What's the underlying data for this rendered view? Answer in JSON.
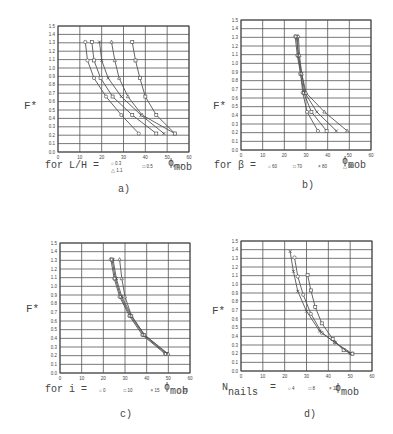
{
  "figure": {
    "panels": [
      {
        "id": "a",
        "caption": "a)",
        "ylabel": "F*",
        "xlabel_symbol": "ϕ",
        "xlabel_sub": "mob",
        "legend_prefix": "for L/H =",
        "legend_items": [
          "○ 0.3",
          "□ 0.5",
          "× 0.7"
        ],
        "legend_items_2": [
          "△ 1.1"
        ]
      },
      {
        "id": "b",
        "caption": "b)",
        "ylabel": "F*",
        "xlabel_symbol": "ϕ",
        "xlabel_sub": "mob",
        "legend_prefix": "for β =",
        "legend_items": [
          "○ 60",
          "□ 70",
          "× 80",
          "△ 90"
        ]
      },
      {
        "id": "c",
        "caption": "c)",
        "ylabel": "F*",
        "xlabel_symbol": "ϕ",
        "xlabel_sub": "mob",
        "legend_prefix": "for i =",
        "legend_items": [
          "○ 0",
          "□ 10",
          "× 15",
          "△ 20"
        ]
      },
      {
        "id": "d",
        "caption": "d)",
        "ylabel": "F*",
        "xlabel_symbol": "ϕ",
        "xlabel_sub": "mob",
        "legend_prefix_main": "N",
        "legend_prefix_sub": "nails",
        "legend_eq": "=",
        "legend_items": [
          "○ 4",
          "□ 8",
          "× 12"
        ]
      }
    ]
  },
  "chart_data": [
    {
      "type": "line",
      "title": "a)",
      "xlabel": "ϕmob",
      "ylabel": "F*",
      "xlim": [
        0,
        60
      ],
      "ylim": [
        0,
        1.5
      ],
      "xticks": [
        0,
        10,
        20,
        30,
        40,
        50,
        60
      ],
      "yticks": [
        0.0,
        0.1,
        0.2,
        0.3,
        0.4,
        0.5,
        0.6,
        0.7,
        0.8,
        0.9,
        1.0,
        1.1,
        1.2,
        1.3,
        1.4,
        1.5
      ],
      "grid": true,
      "legend": "for L/H",
      "series": [
        {
          "name": "0.3",
          "points": [
            [
              12.5,
              1.31
            ],
            [
              13.5,
              1.09
            ],
            [
              16.5,
              0.88
            ],
            [
              22,
              0.66
            ],
            [
              29,
              0.44
            ],
            [
              37,
              0.22
            ]
          ]
        },
        {
          "name": "0.5",
          "points": [
            [
              15.5,
              1.31
            ],
            [
              16.5,
              1.09
            ],
            [
              19.5,
              0.88
            ],
            [
              25,
              0.66
            ],
            [
              34,
              0.44
            ],
            [
              45,
              0.22
            ]
          ]
        },
        {
          "name": "0.7",
          "points": [
            [
              19,
              1.31
            ],
            [
              20,
              1.09
            ],
            [
              23,
              0.88
            ],
            [
              29,
              0.66
            ],
            [
              38,
              0.44
            ],
            [
              48.5,
              0.22
            ]
          ]
        },
        {
          "name": "1.1",
          "points": [
            [
              24.5,
              1.31
            ],
            [
              26,
              1.09
            ],
            [
              28,
              0.88
            ],
            [
              32,
              0.66
            ],
            [
              38.5,
              0.44
            ],
            [
              53.5,
              0.22
            ]
          ]
        },
        {
          "name": "extra",
          "points": [
            [
              34,
              1.31
            ],
            [
              35.5,
              1.09
            ],
            [
              37.5,
              0.88
            ],
            [
              40,
              0.66
            ],
            [
              45,
              0.44
            ],
            [
              53.5,
              0.22
            ]
          ]
        }
      ]
    },
    {
      "type": "line",
      "title": "b)",
      "xlabel": "ϕmob",
      "ylabel": "F*",
      "xlim": [
        0,
        60
      ],
      "ylim": [
        0,
        1.5
      ],
      "xticks": [
        0,
        10,
        20,
        30,
        40,
        50,
        60
      ],
      "yticks": [
        0.0,
        0.1,
        0.2,
        0.3,
        0.4,
        0.5,
        0.6,
        0.7,
        0.8,
        0.9,
        1.0,
        1.1,
        1.2,
        1.3,
        1.4,
        1.5
      ],
      "grid": true,
      "legend": "for β",
      "series": [
        {
          "name": "60",
          "points": [
            [
              25,
              1.31
            ],
            [
              26,
              1.09
            ],
            [
              27.5,
              0.88
            ],
            [
              28.5,
              0.66
            ],
            [
              30.5,
              0.44
            ],
            [
              35.5,
              0.22
            ]
          ]
        },
        {
          "name": "70",
          "points": [
            [
              25.5,
              1.31
            ],
            [
              26.5,
              1.09
            ],
            [
              27.5,
              0.88
            ],
            [
              29,
              0.66
            ],
            [
              32.5,
              0.44
            ],
            [
              39.5,
              0.22
            ]
          ]
        },
        {
          "name": "80",
          "points": [
            [
              26,
              1.31
            ],
            [
              26.5,
              1.09
            ],
            [
              28,
              0.88
            ],
            [
              29.5,
              0.66
            ],
            [
              35,
              0.44
            ],
            [
              44,
              0.22
            ]
          ]
        },
        {
          "name": "90",
          "points": [
            [
              26.5,
              1.31
            ],
            [
              27,
              1.09
            ],
            [
              28,
              0.88
            ],
            [
              30,
              0.66
            ],
            [
              38.5,
              0.44
            ],
            [
              49,
              0.22
            ]
          ]
        }
      ]
    },
    {
      "type": "line",
      "title": "c)",
      "xlabel": "ϕmob",
      "ylabel": "F*",
      "xlim": [
        0,
        60
      ],
      "ylim": [
        0,
        1.5
      ],
      "xticks": [
        0,
        10,
        20,
        30,
        40,
        50,
        60
      ],
      "yticks": [
        0.0,
        0.1,
        0.2,
        0.3,
        0.4,
        0.5,
        0.6,
        0.7,
        0.8,
        0.9,
        1.0,
        1.1,
        1.2,
        1.3,
        1.4,
        1.5
      ],
      "grid": true,
      "legend": "for i",
      "series": [
        {
          "name": "0",
          "points": [
            [
              23.5,
              1.31
            ],
            [
              25,
              1.09
            ],
            [
              27.5,
              0.88
            ],
            [
              32,
              0.66
            ],
            [
              38,
              0.44
            ],
            [
              48.5,
              0.22
            ]
          ]
        },
        {
          "name": "10",
          "points": [
            [
              24,
              1.31
            ],
            [
              25.5,
              1.09
            ],
            [
              28,
              0.88
            ],
            [
              32.5,
              0.66
            ],
            [
              38.5,
              0.44
            ],
            [
              49,
              0.22
            ]
          ]
        },
        {
          "name": "15",
          "points": [
            [
              24.5,
              1.31
            ],
            [
              26,
              1.09
            ],
            [
              28.5,
              0.88
            ],
            [
              33,
              0.66
            ],
            [
              39,
              0.44
            ],
            [
              49.5,
              0.22
            ]
          ]
        },
        {
          "name": "20",
          "points": [
            [
              27.5,
              1.31
            ],
            [
              28.5,
              1.09
            ],
            [
              30,
              0.88
            ],
            [
              33,
              0.66
            ],
            [
              39,
              0.44
            ],
            [
              50,
              0.22
            ]
          ]
        }
      ]
    },
    {
      "type": "line",
      "title": "d)",
      "xlabel": "ϕmob",
      "ylabel": "F*",
      "xlim": [
        0,
        60
      ],
      "ylim": [
        0,
        1.5
      ],
      "xticks": [
        0,
        10,
        20,
        30,
        40,
        50,
        60
      ],
      "yticks": [
        0.0,
        0.1,
        0.2,
        0.3,
        0.4,
        0.5,
        0.6,
        0.7,
        0.8,
        0.9,
        1.0,
        1.1,
        1.2,
        1.3,
        1.4,
        1.5
      ],
      "grid": true,
      "legend": "Nnails",
      "series": [
        {
          "name": "4",
          "points": [
            [
              24.5,
              1.31
            ],
            [
              26,
              1.09
            ],
            [
              28.5,
              0.88
            ],
            [
              32,
              0.66
            ],
            [
              37,
              0.44
            ],
            [
              43,
              0.33
            ],
            [
              51,
              0.2
            ]
          ]
        },
        {
          "name": "8",
          "points": [
            [
              30.5,
              1.11
            ],
            [
              32,
              0.93
            ],
            [
              34,
              0.74
            ],
            [
              37,
              0.55
            ],
            [
              42,
              0.37
            ],
            [
              47,
              0.24
            ],
            [
              51,
              0.2
            ]
          ]
        },
        {
          "name": "12",
          "points": [
            [
              22.5,
              1.38
            ],
            [
              24,
              1.15
            ],
            [
              26,
              0.92
            ],
            [
              30,
              0.69
            ],
            [
              36,
              0.46
            ],
            [
              43,
              0.33
            ],
            [
              50,
              0.2
            ]
          ]
        }
      ]
    }
  ]
}
